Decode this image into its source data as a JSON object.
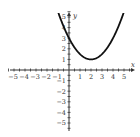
{
  "chart_data": {
    "type": "line",
    "title": "",
    "xlabel": "x",
    "ylabel": "y",
    "xlim": [
      -5.5,
      5.5
    ],
    "ylim": [
      -5.5,
      5.5
    ],
    "grid": false,
    "legend": null,
    "x_ticks": [
      -5,
      -4,
      -3,
      -2,
      -1,
      1,
      2,
      3,
      4,
      5
    ],
    "y_ticks": [
      -5,
      -4,
      -3,
      -2,
      -1,
      1,
      2,
      3,
      4,
      5
    ],
    "x_tick_labels": [
      "−5",
      "−4",
      "−3",
      "−2",
      "−1",
      "1",
      "2",
      "3",
      "4",
      "5"
    ],
    "y_tick_labels": [
      "−5",
      "−4",
      "−3",
      "−2",
      "−1",
      "1",
      "2",
      "3",
      "4",
      "5"
    ],
    "series": [
      {
        "name": "parabola",
        "expression": "y = 0.5(x - 2)^2 + 1",
        "vertex": [
          2,
          1
        ],
        "y_intercept": 3,
        "x": [
          -1.2,
          -1,
          0,
          1,
          2,
          3,
          4,
          5,
          5.2
        ],
        "values": [
          6.12,
          5.5,
          3,
          1.5,
          1,
          1.5,
          3,
          5.5,
          6.12
        ]
      }
    ]
  },
  "colors": {
    "axis": "#333333",
    "curve": "#111111",
    "text": "#333333"
  }
}
